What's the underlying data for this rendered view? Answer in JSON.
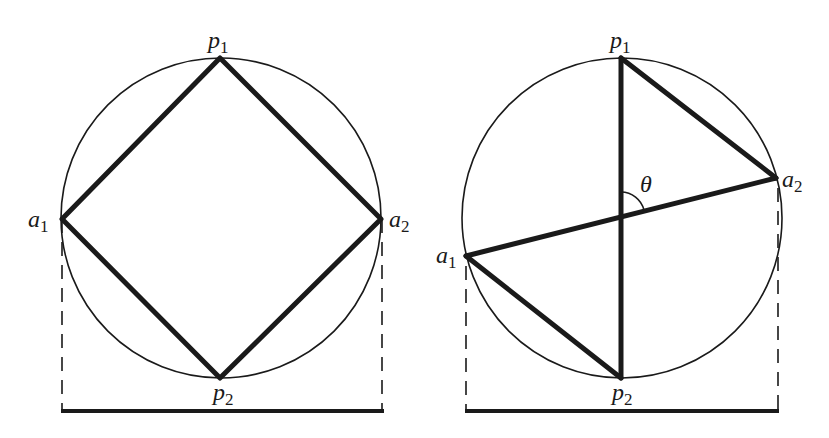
{
  "figure": {
    "left_panel": {
      "name": "square-inscribed",
      "circle": {
        "cx": 221,
        "cy": 218,
        "r": 160
      },
      "points": {
        "p1": {
          "label": "p",
          "sub": "1",
          "x": 220,
          "y": 58
        },
        "a2": {
          "label": "a",
          "sub": "2",
          "x": 381,
          "y": 219
        },
        "p2": {
          "label": "p",
          "sub": "2",
          "x": 220,
          "y": 378
        },
        "a1": {
          "label": "a",
          "sub": "1",
          "x": 62,
          "y": 219
        }
      },
      "width_bar": {
        "x1": 62,
        "x2": 383,
        "y": 411
      }
    },
    "right_panel": {
      "name": "crossed-chords",
      "circle": {
        "cx": 622,
        "cy": 218,
        "r": 160
      },
      "points": {
        "p1": {
          "label": "p",
          "sub": "1",
          "x": 621,
          "y": 58
        },
        "a2": {
          "label": "a",
          "sub": "2",
          "x": 776,
          "y": 178
        },
        "p2": {
          "label": "p",
          "sub": "2",
          "x": 621,
          "y": 378
        },
        "a1": {
          "label": "a",
          "sub": "1",
          "x": 466,
          "y": 256
        }
      },
      "angle_label": "θ",
      "width_bar": {
        "x1": 466,
        "x2": 778,
        "y": 411
      }
    }
  },
  "labels": {
    "left_p1": "p",
    "left_p1_sub": "1",
    "left_p2": "p",
    "left_p2_sub": "2",
    "left_a1": "a",
    "left_a1_sub": "1",
    "left_a2": "a",
    "left_a2_sub": "2",
    "right_p1": "p",
    "right_p1_sub": "1",
    "right_p2": "p",
    "right_p2_sub": "2",
    "right_a1": "a",
    "right_a1_sub": "1",
    "right_a2": "a",
    "right_a2_sub": "2",
    "theta": "θ"
  }
}
